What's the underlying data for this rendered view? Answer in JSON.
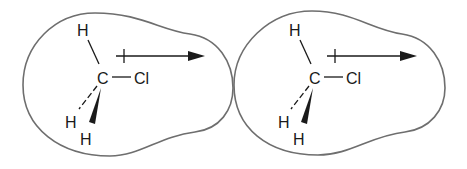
{
  "diagram": {
    "molecules": [
      {
        "id": "left",
        "atoms": {
          "carbon": "C",
          "chlorine": "Cl",
          "h_top": "H",
          "h_dash": "H",
          "h_wedge": "H"
        },
        "dipole_arrow": "crossed-arrow pointing toward Cl"
      },
      {
        "id": "right",
        "atoms": {
          "carbon": "C",
          "chlorine": "Cl",
          "h_top": "H",
          "h_dash": "H",
          "h_wedge": "H"
        },
        "dipole_arrow": "crossed-arrow pointing toward Cl"
      }
    ],
    "colors": {
      "outline": "#6e6e6e",
      "ink": "#1a1a1a",
      "background": "#ffffff"
    }
  }
}
